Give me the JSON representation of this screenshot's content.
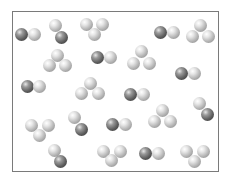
{
  "figure": {
    "colors": {
      "light_atom": "#c8c8c8",
      "dark_atom": "#555555",
      "frame": "#7a7a7a"
    },
    "atom_diameter": 13,
    "molecules": [
      {
        "type": "diatomic",
        "atoms": [
          {
            "x": 21,
            "y": 34,
            "shade": "dark"
          },
          {
            "x": 34,
            "y": 34,
            "shade": "light"
          }
        ]
      },
      {
        "type": "diatomic",
        "atoms": [
          {
            "x": 55,
            "y": 25,
            "shade": "light"
          },
          {
            "x": 61,
            "y": 37,
            "shade": "dark"
          }
        ]
      },
      {
        "type": "triatomic",
        "atoms": [
          {
            "x": 86,
            "y": 24,
            "shade": "light"
          },
          {
            "x": 102,
            "y": 24,
            "shade": "light"
          },
          {
            "x": 94,
            "y": 34,
            "shade": "light"
          }
        ]
      },
      {
        "type": "diatomic",
        "atoms": [
          {
            "x": 160,
            "y": 32,
            "shade": "dark"
          },
          {
            "x": 173,
            "y": 32,
            "shade": "light"
          }
        ]
      },
      {
        "type": "triatomic",
        "atoms": [
          {
            "x": 200,
            "y": 25,
            "shade": "light"
          },
          {
            "x": 192,
            "y": 36,
            "shade": "light"
          },
          {
            "x": 208,
            "y": 36,
            "shade": "light"
          }
        ]
      },
      {
        "type": "triatomic",
        "atoms": [
          {
            "x": 57,
            "y": 55,
            "shade": "light"
          },
          {
            "x": 49,
            "y": 65,
            "shade": "light"
          },
          {
            "x": 65,
            "y": 65,
            "shade": "light"
          }
        ]
      },
      {
        "type": "diatomic",
        "atoms": [
          {
            "x": 97,
            "y": 57,
            "shade": "dark"
          },
          {
            "x": 110,
            "y": 57,
            "shade": "light"
          }
        ]
      },
      {
        "type": "triatomic",
        "atoms": [
          {
            "x": 141,
            "y": 51,
            "shade": "light"
          },
          {
            "x": 133,
            "y": 63,
            "shade": "light"
          },
          {
            "x": 149,
            "y": 63,
            "shade": "light"
          }
        ]
      },
      {
        "type": "diatomic",
        "atoms": [
          {
            "x": 181,
            "y": 73,
            "shade": "dark"
          },
          {
            "x": 194,
            "y": 73,
            "shade": "light"
          }
        ]
      },
      {
        "type": "diatomic",
        "atoms": [
          {
            "x": 27,
            "y": 86,
            "shade": "dark"
          },
          {
            "x": 39,
            "y": 86,
            "shade": "light"
          }
        ]
      },
      {
        "type": "triatomic",
        "atoms": [
          {
            "x": 90,
            "y": 83,
            "shade": "light"
          },
          {
            "x": 81,
            "y": 93,
            "shade": "light"
          },
          {
            "x": 98,
            "y": 93,
            "shade": "light"
          }
        ]
      },
      {
        "type": "diatomic",
        "atoms": [
          {
            "x": 130,
            "y": 94,
            "shade": "dark"
          },
          {
            "x": 143,
            "y": 94,
            "shade": "light"
          }
        ]
      },
      {
        "type": "diatomic",
        "atoms": [
          {
            "x": 199,
            "y": 103,
            "shade": "light"
          },
          {
            "x": 207,
            "y": 114,
            "shade": "dark"
          }
        ]
      },
      {
        "type": "triatomic",
        "atoms": [
          {
            "x": 162,
            "y": 110,
            "shade": "light"
          },
          {
            "x": 154,
            "y": 121,
            "shade": "light"
          },
          {
            "x": 170,
            "y": 121,
            "shade": "light"
          }
        ]
      },
      {
        "type": "diatomic",
        "atoms": [
          {
            "x": 74,
            "y": 117,
            "shade": "light"
          },
          {
            "x": 81,
            "y": 129,
            "shade": "dark"
          }
        ]
      },
      {
        "type": "diatomic",
        "atoms": [
          {
            "x": 112,
            "y": 124,
            "shade": "dark"
          },
          {
            "x": 125,
            "y": 124,
            "shade": "light"
          }
        ]
      },
      {
        "type": "triatomic",
        "atoms": [
          {
            "x": 31,
            "y": 125,
            "shade": "light"
          },
          {
            "x": 48,
            "y": 125,
            "shade": "light"
          },
          {
            "x": 39,
            "y": 135,
            "shade": "light"
          }
        ]
      },
      {
        "type": "diatomic",
        "atoms": [
          {
            "x": 54,
            "y": 150,
            "shade": "light"
          },
          {
            "x": 60,
            "y": 161,
            "shade": "dark"
          }
        ]
      },
      {
        "type": "triatomic",
        "atoms": [
          {
            "x": 103,
            "y": 151,
            "shade": "light"
          },
          {
            "x": 120,
            "y": 151,
            "shade": "light"
          },
          {
            "x": 111,
            "y": 160,
            "shade": "light"
          }
        ]
      },
      {
        "type": "diatomic",
        "atoms": [
          {
            "x": 145,
            "y": 153,
            "shade": "dark"
          },
          {
            "x": 158,
            "y": 153,
            "shade": "light"
          }
        ]
      },
      {
        "type": "triatomic",
        "atoms": [
          {
            "x": 186,
            "y": 151,
            "shade": "light"
          },
          {
            "x": 203,
            "y": 151,
            "shade": "light"
          },
          {
            "x": 194,
            "y": 161,
            "shade": "light"
          }
        ]
      }
    ]
  }
}
